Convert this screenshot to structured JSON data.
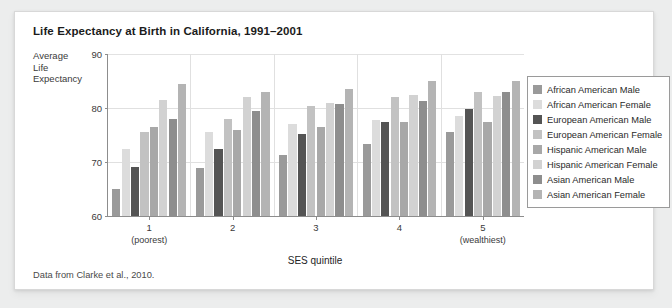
{
  "figure": {
    "title": "Life Expectancy at Birth in California, 1991–2001",
    "source_note": "Data from Clarke et al., 2010.",
    "y_axis_label_lines": [
      "Average",
      "Life",
      "Expectancy"
    ],
    "x_axis_title": "SES quintile"
  },
  "chart_data": {
    "type": "bar",
    "title": "Life Expectancy at Birth in California, 1991–2001",
    "xlabel": "SES quintile",
    "ylabel": "Average Life Expectancy",
    "ylim": [
      60,
      90
    ],
    "yticks": [
      60,
      70,
      80,
      90
    ],
    "grid": true,
    "legend_position": "right",
    "categories": [
      "1",
      "2",
      "3",
      "4",
      "5"
    ],
    "category_sublabels": [
      "(poorest)",
      "",
      "",
      "",
      "(wealthiest)"
    ],
    "series": [
      {
        "name": "African American Male",
        "color": "#9a9a9a",
        "values": [
          65.0,
          68.8,
          71.3,
          73.3,
          75.5
        ]
      },
      {
        "name": "African American Female",
        "color": "#dcdcdc",
        "values": [
          72.5,
          75.5,
          77.0,
          77.8,
          78.5
        ]
      },
      {
        "name": "European American Male",
        "color": "#545454",
        "values": [
          69.0,
          72.5,
          75.2,
          77.5,
          79.8
        ]
      },
      {
        "name": "European American Female",
        "color": "#c2c2c2",
        "values": [
          75.5,
          78.0,
          80.3,
          82.0,
          83.0
        ]
      },
      {
        "name": "Hispanic American Male",
        "color": "#a8a8a8",
        "values": [
          76.5,
          76.0,
          76.5,
          77.5,
          77.5
        ]
      },
      {
        "name": "Hispanic American Female",
        "color": "#d2d2d2",
        "values": [
          81.5,
          82.0,
          81.0,
          82.5,
          82.3
        ]
      },
      {
        "name": "Asian American Male",
        "color": "#8e8e8e",
        "values": [
          78.0,
          79.5,
          80.7,
          81.3,
          83.0
        ]
      },
      {
        "name": "Asian American Female",
        "color": "#b4b4b4",
        "values": [
          84.5,
          83.0,
          83.5,
          85.0,
          85.0
        ]
      }
    ]
  }
}
